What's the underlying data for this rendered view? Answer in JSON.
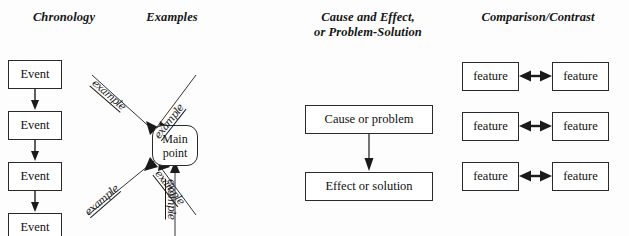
{
  "page": {
    "background_color": "#fdfdfd",
    "ink_color": "#111111",
    "box_border_color": "#2a2a2a"
  },
  "headings": {
    "chronology": "Chronology",
    "examples": "Examples",
    "cause_line1": "Cause and Effect,",
    "cause_line2": "or Problem-Solution",
    "comparison": "Comparison/Contrast"
  },
  "chronology": {
    "events": [
      {
        "label": "Event"
      },
      {
        "label": "Event"
      },
      {
        "label": "Event"
      },
      {
        "label": "Event"
      }
    ],
    "connector_icon": "down-arrow-icon"
  },
  "examples": {
    "center_line1": "Main",
    "center_line2": "point",
    "spokes": [
      {
        "label": "example",
        "direction": "upper-left"
      },
      {
        "label": "example",
        "direction": "upper-right"
      },
      {
        "label": "example",
        "direction": "lower-left"
      },
      {
        "label": "example",
        "direction": "lower-right"
      },
      {
        "label": "example",
        "direction": "bottom"
      }
    ]
  },
  "cause_effect": {
    "cause": "Cause or problem",
    "effect": "Effect or solution",
    "connector_icon": "down-arrow-icon"
  },
  "comparison": {
    "rows": [
      {
        "left": "feature",
        "right": "feature"
      },
      {
        "left": "feature",
        "right": "feature"
      },
      {
        "left": "feature",
        "right": "feature"
      }
    ],
    "connector_icon": "double-headed-arrow-icon"
  }
}
